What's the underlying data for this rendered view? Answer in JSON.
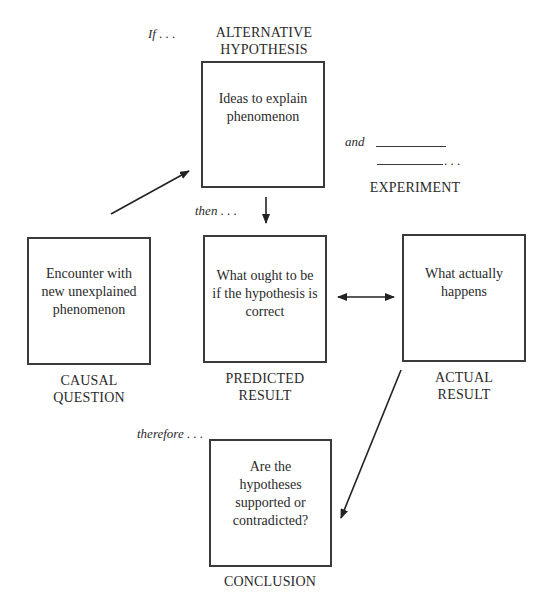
{
  "diagram": {
    "top_cut_text": "...",
    "connectors": {
      "if": "If . . .",
      "then": "then . . .",
      "and": "and",
      "blank_ellipsis": ". . .",
      "therefore": "therefore . . ."
    },
    "nodes": {
      "hypothesis": {
        "label_lines": [
          "ALTERNATIVE",
          "HYPOTHESIS"
        ],
        "text": "Ideas to explain phenomenon"
      },
      "experiment": {
        "label": "EXPERIMENT"
      },
      "question": {
        "label_lines": [
          "CAUSAL",
          "QUESTION"
        ],
        "text": "Encounter with new unexplained phenomenon"
      },
      "predicted": {
        "label_lines": [
          "PREDICTED",
          "RESULT"
        ],
        "text": "What ought to be if the hypothesis is correct"
      },
      "actual": {
        "label_lines": [
          "ACTUAL",
          "RESULT"
        ],
        "text": "What actually happens"
      },
      "conclusion": {
        "label": "CONCLUSION",
        "text": "Are the hypotheses supported or contradicted?"
      }
    },
    "edges": [
      {
        "from": "question",
        "to": "hypothesis",
        "type": "arrow"
      },
      {
        "from": "hypothesis",
        "to": "predicted",
        "type": "arrow"
      },
      {
        "from": "predicted",
        "to": "actual",
        "type": "double-arrow"
      },
      {
        "from": "actual",
        "to": "conclusion",
        "type": "arrow"
      }
    ]
  }
}
